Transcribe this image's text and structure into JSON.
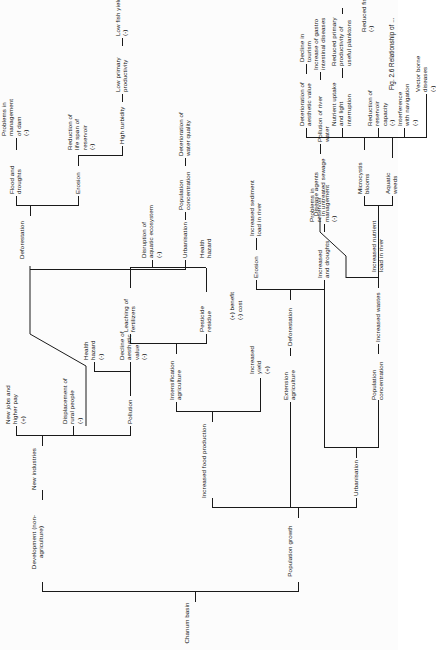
{
  "figure": {
    "root": "Chanum basin",
    "caption": "Fig. 2.6  Relationship of ...",
    "legend": {
      "benefit": "(+)  benefit",
      "cost": "(-)  cost"
    }
  },
  "nodes": {
    "development": "Development (non-agriculture)",
    "new_industries": "New industries",
    "new_jobs": "New jobs and\nhigher pay\n(+)",
    "displacement": "Displacement of\nrural people\n(-)",
    "pollution": "Pollution",
    "health_hazard_poll": "Health\nhazard\n(-)",
    "decline_aesthetic": "Decline of\naesthetic\nvalue\n(-)",
    "population_growth": "Population growth",
    "increased_food": "Increased food production",
    "intensification": "Intensification\nagriculture",
    "leaching": "Leaching of\nfertilizers",
    "pesticide": "Pesticide\nresidue",
    "disruption_aquatic": "Disruption of\naquatic ecosystem\n(-)",
    "health_hazard_pest": "Health\nhazard",
    "increased_yield": "Increased\nyield\n(+)",
    "extension": "Extension\nagriculture",
    "deforestation_a": "Deforestation",
    "erosion_a": "Erosion",
    "sediment_load": "Increased sediment\nload in river",
    "floods_droughts": "Increased\nand droughts",
    "reservoir_problems": "Problems in\nreservoir\nmanagement\n(-)",
    "urbanisation_a": "Urbanisation",
    "pop_concentration_a": "Population\nconcentration",
    "increased_wastes": "Increased  wastes",
    "nutrient_load": "Increased  nutrient\nload in river",
    "disease_agents": "Disease agents\nin untreated sewage",
    "pollution_river": "Pollution of  river water",
    "gastro": "Increase of  gastro\nintestinal diseases",
    "aquatic_weeds": "Aquatic\nweeds",
    "microcystis": "Microcystis\nblooms",
    "interference_nav": "Interference\nwith navigation\n(-)",
    "vector_borne": "Vector  borne\ndiseases\n(-)",
    "reduction_reservoir": "Reduction of\nreservoir\ncapacity\n(-)",
    "nutrient_uptake": "Nutrient  uptake\nand  light\ninterruption",
    "reduced_primary": "Reduced primary\nproductivity of\nuseful planktons",
    "reduced_fish": "Reduced  fish yield\n(-)",
    "deterioration_aesthetic": "Deterioration of\naesthetic value",
    "decline_tourism": "Decline in\ntourism",
    "deforestation_b": "Deforestation",
    "flood_droughts_b": "Flood and\ndroughts",
    "dam_problems": "Problems in\nmanagement\nof dam\n(-)",
    "erosion_b": "Erosion",
    "reduction_lifespan": "Reduction of\nlife span of\nreservoir\n(-)",
    "high_turbidity": "High turbidity",
    "low_primary": "Low primary\nproductivity",
    "low_fish": "Low fish yield\n(-)",
    "urbanisation_b": "Urbanisation",
    "pop_concentration_b": "Population\nconcentration",
    "deterioration_water": "Deterioration of\nwater quality"
  }
}
